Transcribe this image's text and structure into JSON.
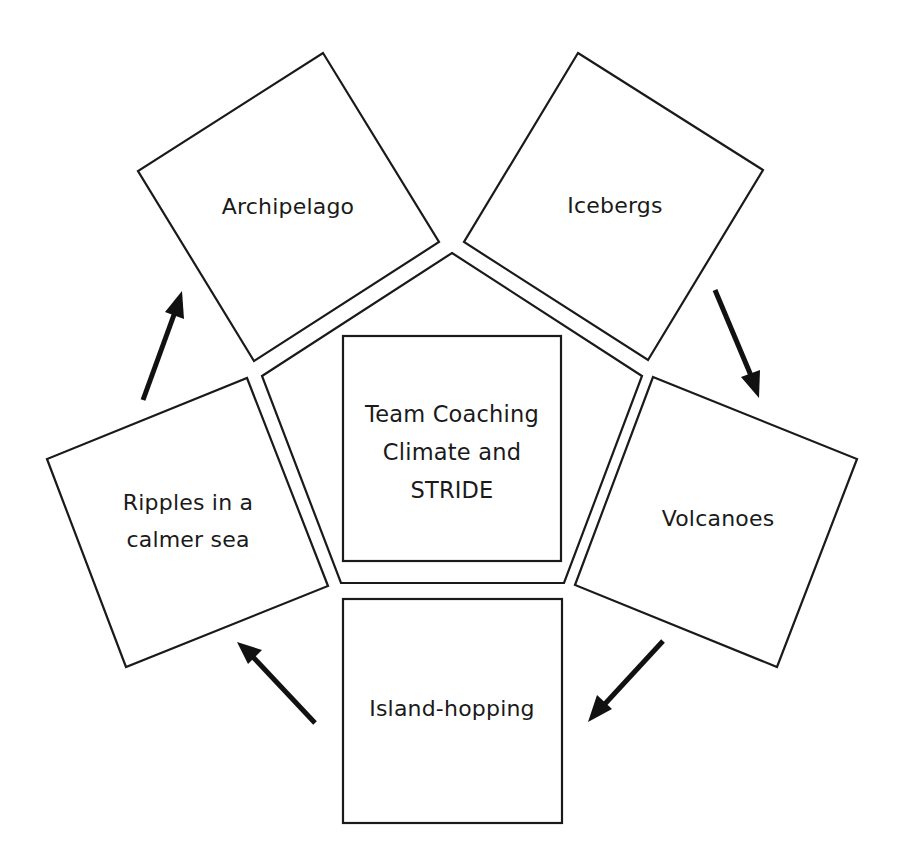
{
  "diagram": {
    "center": {
      "lines": [
        "Team Coaching",
        "Climate and",
        "STRIDE"
      ]
    },
    "stages": [
      {
        "id": "archipelago",
        "lines": [
          "Archipelago"
        ]
      },
      {
        "id": "icebergs",
        "lines": [
          "Icebergs"
        ]
      },
      {
        "id": "volcanoes",
        "lines": [
          "Volcanoes"
        ]
      },
      {
        "id": "island-hopping",
        "lines": [
          "Island-hopping"
        ]
      },
      {
        "id": "ripples",
        "lines": [
          "Ripples in a",
          "calmer sea"
        ]
      }
    ],
    "flow": [
      {
        "from": "archipelago",
        "to": "icebergs"
      },
      {
        "from": "icebergs",
        "to": "volcanoes"
      },
      {
        "from": "volcanoes",
        "to": "island-hopping"
      },
      {
        "from": "island-hopping",
        "to": "ripples"
      },
      {
        "from": "ripples",
        "to": "archipelago"
      }
    ],
    "colors": {
      "stroke": "#1a1a1a",
      "arrow": "#111111",
      "background": "#ffffff"
    }
  }
}
